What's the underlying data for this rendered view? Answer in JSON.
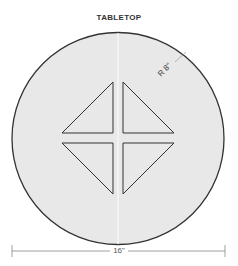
{
  "title": "TABLETOP",
  "radius_label": "R 8\"",
  "width_label": "16\"",
  "colors": {
    "fill": "#e8e8e8",
    "stroke": "#333333",
    "dim_line": "#888888"
  }
}
